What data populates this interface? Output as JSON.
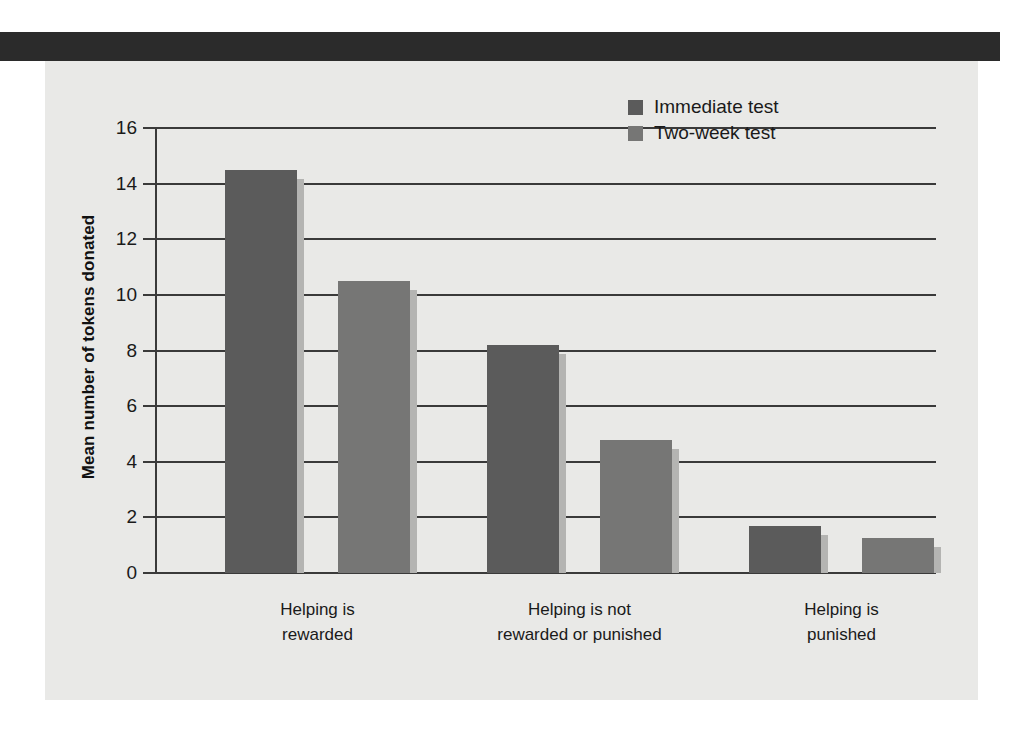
{
  "figure": {
    "panel_bg": "#e9e9e7",
    "header_rule_color": "#2b2b2b",
    "axis_color": "#3a3a3a"
  },
  "chart_data": {
    "type": "bar",
    "title": "",
    "xlabel": "",
    "ylabel": "Mean number of tokens donated",
    "ylim": [
      0,
      16
    ],
    "ytick_step": 2,
    "yticks": [
      "0",
      "2",
      "4",
      "6",
      "8",
      "10",
      "12",
      "14",
      "16"
    ],
    "grid": true,
    "legend_position": "top-right",
    "categories": [
      "Helping is\nrewarded",
      "Helping is not\nrewarded or punished",
      "Helping is\npunished"
    ],
    "series": [
      {
        "name": "Immediate test",
        "color": "#5b5b5b",
        "values": [
          14.5,
          8.2,
          1.7
        ]
      },
      {
        "name": "Two-week test",
        "color": "#767675",
        "values": [
          10.5,
          4.8,
          1.25
        ]
      }
    ]
  }
}
